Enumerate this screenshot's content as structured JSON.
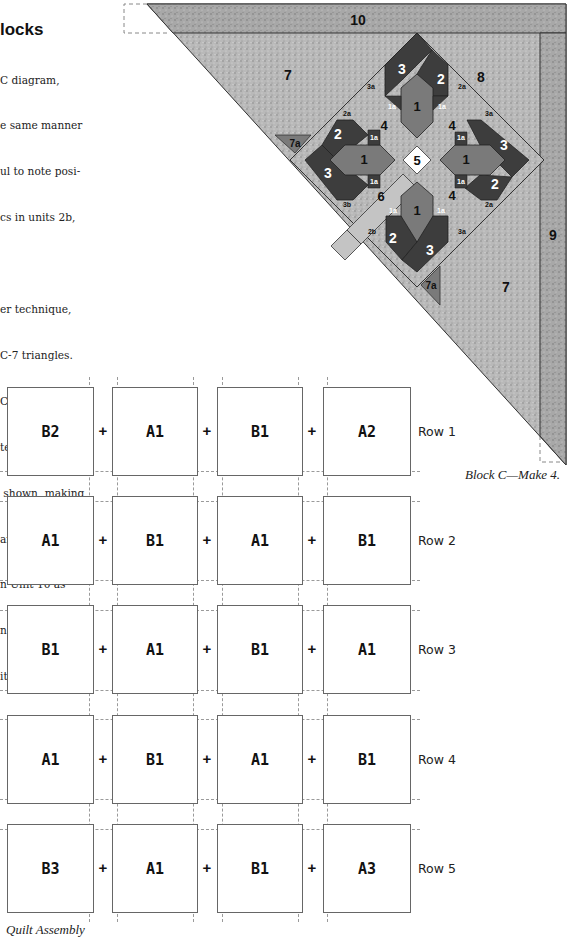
{
  "instructions": {
    "heading": "locks",
    "lines": [
      "C diagram,",
      "e same manner",
      "ul to note posi-",
      "cs in units 2b,",
      "",
      "er technique,",
      "C-7 triangles.",
      "C diagram, join",
      "te sides of each",
      " shown, making",
      "arge triangle.",
      "n Unit 10 as",
      "n Unit 7 trian-",
      "its 9 and 10."
    ]
  },
  "block_diagram": {
    "caption": "Block C—Make 4.",
    "colors": {
      "dark": "#3d3d3d",
      "medium": "#7a7a7a",
      "light": "#bdbdbd",
      "white": "#ffffff",
      "speckle_bg": "#b4b4b4",
      "outline": "#222222"
    },
    "labels": {
      "u10": "10",
      "u9": "9",
      "u8": "8",
      "u7_top": "7",
      "u7_bottom": "7",
      "u7a_left": "7a",
      "u7a_bottom": "7a",
      "u5": "5",
      "u6": "6",
      "u4_tl": "4",
      "u4_tr": "4",
      "u4_br": "4",
      "top_1": "1",
      "top_2": "2",
      "top_3": "3",
      "top_1a_l": "1a",
      "top_1a_r": "1a",
      "top_3a": "3a",
      "top_2a": "2a",
      "left_1": "1",
      "left_2": "2",
      "left_3": "3",
      "left_1a_t": "1a",
      "left_1a_b": "1a",
      "left_2a": "2a",
      "left_3b": "3b",
      "right_1": "1",
      "right_2": "2",
      "right_3": "3",
      "right_1a_t": "1a",
      "right_1a_b": "1a",
      "right_3a": "3a",
      "right_2a": "2a",
      "bottom_1": "1",
      "bottom_2": "2",
      "bottom_3": "3",
      "bottom_1a_l": "1a",
      "bottom_1a_r": "1a",
      "bottom_2b": "2b",
      "bottom_3a": "3a"
    }
  },
  "quilt_assembly": {
    "caption": "Quilt Assembly",
    "plus_sign": "+",
    "rows": [
      {
        "label": "Row 1",
        "blocks": [
          "B2",
          "A1",
          "B1",
          "A2"
        ]
      },
      {
        "label": "Row 2",
        "blocks": [
          "A1",
          "B1",
          "A1",
          "B1"
        ]
      },
      {
        "label": "Row 3",
        "blocks": [
          "B1",
          "A1",
          "B1",
          "A1"
        ]
      },
      {
        "label": "Row 4",
        "blocks": [
          "A1",
          "B1",
          "A1",
          "B1"
        ]
      },
      {
        "label": "Row 5",
        "blocks": [
          "B3",
          "A1",
          "B1",
          "A3"
        ]
      }
    ]
  }
}
